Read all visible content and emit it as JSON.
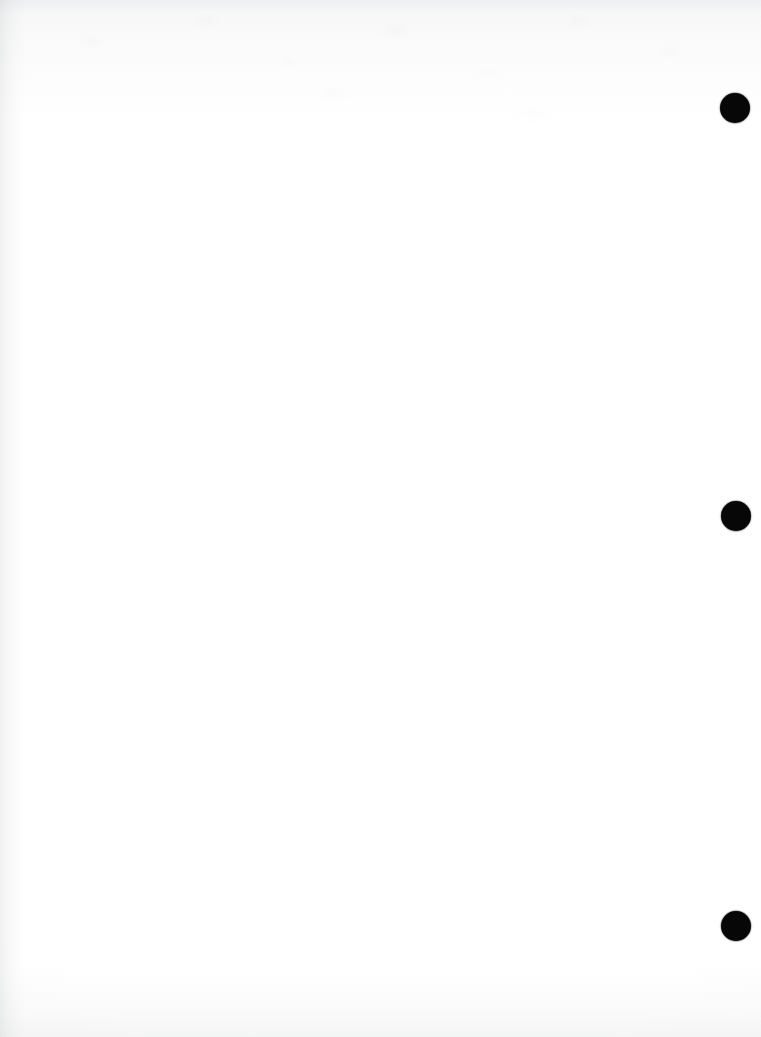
{
  "page": {
    "kind": "scanned-blank-page",
    "width_px": 761,
    "height_px": 1037,
    "background_color": "#ffffff",
    "visible_text": "",
    "note": "Blank scanned sheet; no text, headings, figures or captions are rendered on the page."
  },
  "marks": {
    "label": "margin-dots",
    "description": "Three solid black circular marks in the right margin",
    "count": 3,
    "color": "#070707",
    "radius_px": 15,
    "items": [
      {
        "name": "margin-dot-1",
        "cx": 735,
        "cy": 108,
        "r": 15,
        "color": "#070707"
      },
      {
        "name": "margin-dot-2",
        "cx": 736,
        "cy": 516,
        "r": 15,
        "color": "#070707"
      },
      {
        "name": "margin-dot-3",
        "cx": 736,
        "cy": 926,
        "r": 15,
        "color": "#070707"
      }
    ]
  },
  "artifacts": {
    "left_edge_shadow": {
      "name": "scan-shadow-left",
      "width_px": 26,
      "tone": "#7d8287"
    },
    "bottom_edge_shadow": {
      "name": "scan-shadow-bottom",
      "height_px": 70,
      "tone": "#878c91"
    },
    "top_edge_shadow": {
      "name": "scan-shadow-top",
      "height_px": 14,
      "tone": "#878c91"
    },
    "top_bleed_through": {
      "name": "bleed-through-top",
      "height_px": 120,
      "tone": "#969ba0"
    },
    "paper_grain": {
      "name": "paper-grain",
      "tone": "#787d82"
    }
  }
}
